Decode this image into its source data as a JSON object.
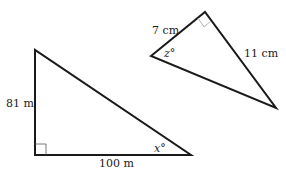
{
  "figure": {
    "left_triangle": {
      "vertical_side_label": "81 m",
      "horizontal_side_label": "100 m",
      "angle_label": "x°",
      "right_angle": "bottom-left"
    },
    "right_triangle": {
      "short_leg_label": "7 cm",
      "long_leg_label": "11 cm",
      "angle_label": "z°",
      "right_angle": "top"
    },
    "colors": {
      "line": "#1a1a1a",
      "right_angle_marker_left": "#333333",
      "right_angle_marker_right": "#aaaaaa"
    }
  }
}
